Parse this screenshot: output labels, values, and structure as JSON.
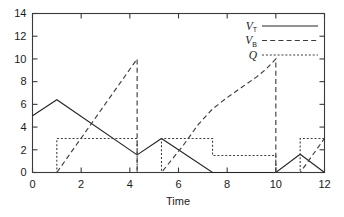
{
  "chart_data": {
    "type": "line",
    "title": "",
    "subtitle": "",
    "xlabel": "Time",
    "ylabel": "",
    "xlim": [
      0,
      12
    ],
    "ylim": [
      0,
      14
    ],
    "xticks": [
      0,
      2,
      4,
      6,
      8,
      10,
      12
    ],
    "yticks": [
      0,
      2,
      4,
      6,
      8,
      10,
      12,
      14
    ],
    "xtick_labels": [
      "0",
      "2",
      "4",
      "6",
      "8",
      "10",
      "12"
    ],
    "ytick_labels": [
      "0",
      "2",
      "4",
      "6",
      "8",
      "10",
      "12",
      "14"
    ],
    "grid": false,
    "legend_position": "top-right",
    "series": [
      {
        "name": "VT",
        "label_main": "V",
        "label_sub": "T",
        "style": "solid",
        "color": "#262626",
        "points": [
          [
            0.0,
            5.0
          ],
          [
            1.0,
            6.4
          ],
          [
            4.3,
            1.55
          ],
          [
            5.3,
            3.0
          ],
          [
            7.4,
            0.0
          ],
          [
            10.0,
            0.0
          ],
          [
            11.0,
            1.6
          ],
          [
            12.0,
            0.0
          ]
        ]
      },
      {
        "name": "VB",
        "label_main": "V",
        "label_sub": "B",
        "style": "dashed",
        "color": "#3d3d3d",
        "points": [
          [
            0.0,
            0.0
          ],
          [
            1.0,
            0.0
          ],
          [
            4.3,
            10.0
          ],
          [
            4.3,
            0.0
          ],
          [
            5.3,
            0.0
          ],
          [
            6.2,
            2.4
          ],
          [
            6.8,
            4.2
          ],
          [
            7.4,
            5.6
          ],
          [
            8.0,
            6.6
          ],
          [
            8.6,
            7.5
          ],
          [
            9.2,
            8.4
          ],
          [
            9.6,
            9.1
          ],
          [
            10.0,
            10.0
          ],
          [
            10.0,
            0.0
          ],
          [
            11.0,
            0.0
          ],
          [
            12.0,
            3.0
          ]
        ]
      },
      {
        "name": "Q",
        "label_main": "Q",
        "label_sub": "",
        "style": "dotted",
        "color": "#3d3d3d",
        "points": [
          [
            0.0,
            0.0
          ],
          [
            1.0,
            0.0
          ],
          [
            1.0,
            3.0
          ],
          [
            4.3,
            3.0
          ],
          [
            4.3,
            0.0
          ],
          [
            5.3,
            0.0
          ],
          [
            5.3,
            3.0
          ],
          [
            7.4,
            3.0
          ],
          [
            7.4,
            1.5
          ],
          [
            10.0,
            1.5
          ],
          [
            10.0,
            0.0
          ],
          [
            11.0,
            0.0
          ],
          [
            11.0,
            3.0
          ],
          [
            12.0,
            3.0
          ]
        ]
      }
    ],
    "legend_entries": [
      {
        "label_main": "V",
        "label_sub": "T",
        "style": "solid"
      },
      {
        "label_main": "V",
        "label_sub": "B",
        "style": "dashed"
      },
      {
        "label_main": "Q",
        "label_sub": "",
        "style": "dotted"
      }
    ]
  },
  "colors": {
    "axis": "#3a3a3a",
    "text": "#1a1a1a",
    "background": "#ffffff"
  }
}
